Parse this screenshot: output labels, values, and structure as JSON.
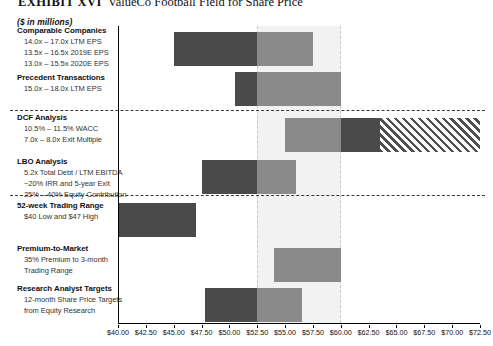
{
  "header": {
    "exhibit": "EXHIBIT XVI",
    "title": "ValueCo Football Field for Share Price",
    "units": "($ in millions)"
  },
  "chart_data": {
    "type": "bar",
    "orientation": "horizontal",
    "title": "ValueCo Football Field for Share Price",
    "subtitle": "($ in millions)",
    "xlabel": "",
    "ylabel": "",
    "xlim": [
      40.0,
      72.5
    ],
    "xtick_step": 2.5,
    "grid": false,
    "legend": "none",
    "value_prefix": "$",
    "shaded_band": {
      "label": "Implied Valuation Range",
      "from": 52.5,
      "to": 60.0
    },
    "xticks": [
      "$40.00",
      "$42.50",
      "$45.00",
      "$47.50",
      "$50.00",
      "$52.50",
      "$55.00",
      "$57.50",
      "$60.00",
      "$62.50",
      "$65.00",
      "$67.50",
      "$70.00",
      "$72.50"
    ],
    "xtick_values": [
      40.0,
      42.5,
      45.0,
      47.5,
      50.0,
      52.5,
      55.0,
      57.5,
      60.0,
      62.5,
      65.0,
      67.5,
      70.0,
      72.5
    ],
    "categories": [
      "Comparable Companies",
      "Precedent Transactions",
      "DCF Analysis",
      "LBO Analysis",
      "52-week Trading Range",
      "Premium-to-Market",
      "Research Analyst Targets"
    ],
    "rows": [
      {
        "name": "Comparable Companies",
        "title": "Comparable Companies",
        "sublines": [
          "14.0x – 17.0x LTM EPS",
          "13.5x – 16.5x 2019E EPS",
          "13.0x – 15.5x 2020E EPS"
        ],
        "low": 45.0,
        "high": 57.5,
        "split": 52.5,
        "segments": [
          {
            "style": "dark",
            "from": 45.0,
            "to": 52.5
          },
          {
            "style": "mid",
            "from": 52.5,
            "to": 57.5
          }
        ]
      },
      {
        "name": "Precedent Transactions",
        "title": "Precedent Transactions",
        "sublines": [
          "15.0x – 18.0x LTM EPS"
        ],
        "low": 50.5,
        "high": 60.0,
        "split": 52.5,
        "segments": [
          {
            "style": "dark",
            "from": 50.5,
            "to": 52.5
          },
          {
            "style": "mid",
            "from": 52.5,
            "to": 60.0
          }
        ]
      },
      {
        "name": "DCF Analysis",
        "title": "DCF Analysis",
        "sublines": [
          "10.5% – 11.5% WACC",
          "7.0x – 8.0x Exit Multiple"
        ],
        "low": 55.0,
        "high": 72.5,
        "split": 60.0,
        "segments": [
          {
            "style": "mid",
            "from": 55.0,
            "to": 60.0
          },
          {
            "style": "dark",
            "from": 60.0,
            "to": 63.5
          },
          {
            "style": "hatch",
            "from": 63.5,
            "to": 72.5
          }
        ]
      },
      {
        "name": "LBO Analysis",
        "title": "LBO Analysis",
        "sublines": [
          "5.2x Total Debt / LTM EBITDA",
          "~20% IRR and 5-year Exit",
          "25% – 40% Equity Contribution"
        ],
        "low": 47.5,
        "high": 56.0,
        "split": 52.5,
        "segments": [
          {
            "style": "dark",
            "from": 47.5,
            "to": 52.5
          },
          {
            "style": "mid",
            "from": 52.5,
            "to": 56.0
          }
        ]
      },
      {
        "name": "52-week Trading Range",
        "title": "52-week Trading Range",
        "sublines": [
          "$40 Low and $47 High"
        ],
        "low": 40.0,
        "high": 47.0,
        "split": null,
        "segments": [
          {
            "style": "dark",
            "from": 40.0,
            "to": 47.0
          }
        ]
      },
      {
        "name": "Premium-to-Market",
        "title": "Premium-to-Market",
        "sublines": [
          "35% Premium to 3-month",
          "Trading Range"
        ],
        "low": 54.0,
        "high": 60.0,
        "split": null,
        "segments": [
          {
            "style": "mid",
            "from": 54.0,
            "to": 60.0
          }
        ]
      },
      {
        "name": "Research Analyst Targets",
        "title": "Research Analyst Targets",
        "sublines": [
          "12-month Share Price Targets",
          "from Equity Research"
        ],
        "low": 47.8,
        "high": 56.5,
        "split": 52.5,
        "segments": [
          {
            "style": "dark",
            "from": 47.8,
            "to": 52.5
          },
          {
            "style": "mid",
            "from": 52.5,
            "to": 56.5
          }
        ]
      }
    ],
    "colors": {
      "dark": "#4a4a4a",
      "mid": "#8a8a8a",
      "hatch": "#4f4f4f",
      "band": "#f2f2f2",
      "band_border": "#c9c9c9",
      "divider": "#3a3a3a",
      "axis": "#000000"
    },
    "dividers_after": [
      "Precedent Transactions",
      "LBO Analysis"
    ]
  }
}
